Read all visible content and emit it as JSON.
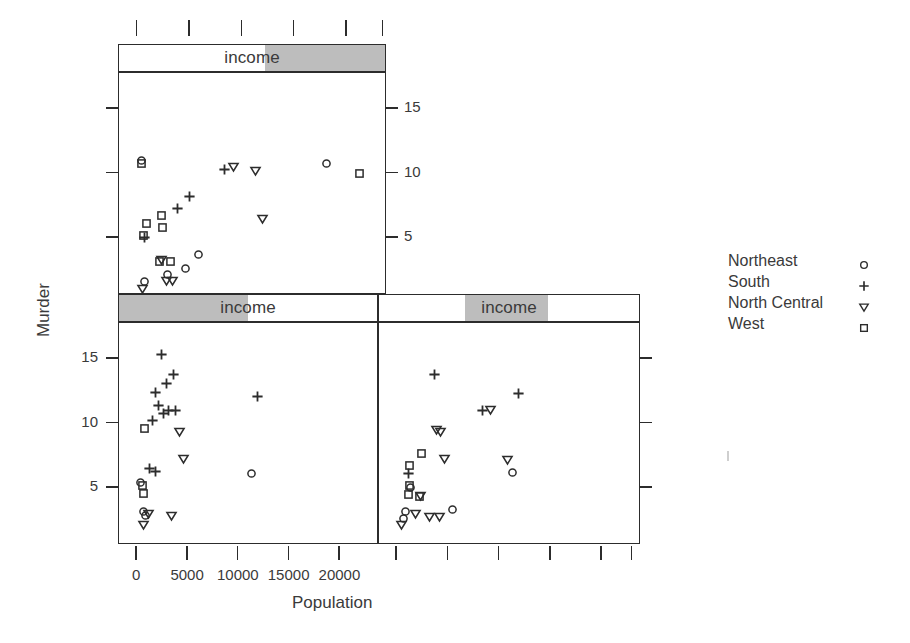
{
  "figure": {
    "type": "trellis-scatter-conditioned",
    "xlabel": "Population",
    "ylabel": "Murder",
    "strip_variable": "income"
  },
  "chart_data": {
    "type": "scatter",
    "title": "",
    "xlabel": "Population",
    "ylabel": "Murder",
    "xlim": [
      -1800,
      23800
    ],
    "ylim": [
      0.6,
      17.8
    ],
    "xticks": [
      0,
      5000,
      10000,
      15000,
      20000
    ],
    "xticklabels": [
      "0",
      "5000",
      "10000",
      "15000",
      "20000"
    ],
    "yticks": [
      5,
      10,
      15
    ],
    "yticklabels": [
      "5",
      "10",
      "15"
    ],
    "grid": false,
    "legend_position": "right",
    "conditioning": {
      "variable": "income",
      "panels": [
        {
          "id": "panel-3",
          "strip_label": "income",
          "shade_start_pct": 55,
          "shade_end_pct": 100,
          "position": "top-left",
          "yaxis_side": "right"
        },
        {
          "id": "panel-1",
          "strip_label": "income",
          "shade_start_pct": 0,
          "shade_end_pct": 50,
          "position": "bottom-left",
          "yaxis_side": "left"
        },
        {
          "id": "panel-2",
          "strip_label": "income",
          "shade_start_pct": 33,
          "shade_end_pct": 65,
          "position": "bottom-right",
          "yaxis_side": "right"
        }
      ]
    },
    "groups": [
      {
        "name": "Northeast",
        "symbol": "circle",
        "glyph": "o"
      },
      {
        "name": "South",
        "symbol": "plus",
        "glyph": "+"
      },
      {
        "name": "North Central",
        "symbol": "triangle-down",
        "glyph": "▽"
      },
      {
        "name": "West",
        "symbol": "square",
        "glyph": "□"
      }
    ],
    "series": [
      {
        "panel": "panel-3",
        "points": [
          {
            "x": 365,
            "y": 10.9,
            "group": "West"
          },
          {
            "x": 365,
            "y": 11.1,
            "group": "Northeast"
          },
          {
            "x": 8277,
            "y": 10.4,
            "group": "South"
          },
          {
            "x": 9111,
            "y": 10.6,
            "group": "North Central"
          },
          {
            "x": 11197,
            "y": 10.3,
            "group": "North Central"
          },
          {
            "x": 17990,
            "y": 10.9,
            "group": "Northeast"
          },
          {
            "x": 21198,
            "y": 10.1,
            "group": "West"
          },
          {
            "x": 4931,
            "y": 8.3,
            "group": "South"
          },
          {
            "x": 3806,
            "y": 7.4,
            "group": "South"
          },
          {
            "x": 2284,
            "y": 6.8,
            "group": "West"
          },
          {
            "x": 11860,
            "y": 6.6,
            "group": "North Central"
          },
          {
            "x": 812,
            "y": 6.2,
            "group": "West"
          },
          {
            "x": 2341,
            "y": 5.9,
            "group": "West"
          },
          {
            "x": 579,
            "y": 5.3,
            "group": "West"
          },
          {
            "x": 637,
            "y": 5.1,
            "group": "South"
          },
          {
            "x": 2110,
            "y": 3.3,
            "group": "West"
          },
          {
            "x": 2280,
            "y": 3.4,
            "group": "North Central"
          },
          {
            "x": 3100,
            "y": 3.3,
            "group": "West"
          },
          {
            "x": 5814,
            "y": 3.8,
            "group": "Northeast"
          },
          {
            "x": 4589,
            "y": 2.7,
            "group": "Northeast"
          },
          {
            "x": 2861,
            "y": 2.3,
            "group": "Northeast"
          },
          {
            "x": 623,
            "y": 1.7,
            "group": "Northeast"
          },
          {
            "x": 2715,
            "y": 1.8,
            "group": "North Central"
          },
          {
            "x": 3301,
            "y": 1.8,
            "group": "North Central"
          },
          {
            "x": 472,
            "y": 1.2,
            "group": "North Central"
          }
        ]
      },
      {
        "panel": "panel-1",
        "points": [
          {
            "x": 2341,
            "y": 15.4,
            "group": "South"
          },
          {
            "x": 3615,
            "y": 13.9,
            "group": "South"
          },
          {
            "x": 2861,
            "y": 13.2,
            "group": "South"
          },
          {
            "x": 1799,
            "y": 12.5,
            "group": "South"
          },
          {
            "x": 2110,
            "y": 11.5,
            "group": "South"
          },
          {
            "x": 11860,
            "y": 12.2,
            "group": "South"
          },
          {
            "x": 2541,
            "y": 10.9,
            "group": "South"
          },
          {
            "x": 3100,
            "y": 11.1,
            "group": "South"
          },
          {
            "x": 3806,
            "y": 11.1,
            "group": "South"
          },
          {
            "x": 1544,
            "y": 10.3,
            "group": "South"
          },
          {
            "x": 681,
            "y": 9.7,
            "group": "West"
          },
          {
            "x": 4205,
            "y": 9.5,
            "group": "North Central"
          },
          {
            "x": 4589,
            "y": 7.4,
            "group": "North Central"
          },
          {
            "x": 1212,
            "y": 6.6,
            "group": "South"
          },
          {
            "x": 1813,
            "y": 6.4,
            "group": "South"
          },
          {
            "x": 11197,
            "y": 6.2,
            "group": "Northeast"
          },
          {
            "x": 365,
            "y": 5.5,
            "group": "Northeast"
          },
          {
            "x": 472,
            "y": 5.3,
            "group": "West"
          },
          {
            "x": 637,
            "y": 4.7,
            "group": "West"
          },
          {
            "x": 579,
            "y": 3.3,
            "group": "Northeast"
          },
          {
            "x": 812,
            "y": 3.0,
            "group": "Northeast"
          },
          {
            "x": 1058,
            "y": 3.1,
            "group": "North Central"
          },
          {
            "x": 3387,
            "y": 3.0,
            "group": "North Central"
          },
          {
            "x": 623,
            "y": 2.3,
            "group": "North Central"
          }
        ]
      },
      {
        "panel": "panel-2",
        "points": [
          {
            "x": 3615,
            "y": 13.9,
            "group": "South"
          },
          {
            "x": 11860,
            "y": 12.4,
            "group": "South"
          },
          {
            "x": 8277,
            "y": 11.1,
            "group": "South"
          },
          {
            "x": 9111,
            "y": 11.2,
            "group": "North Central"
          },
          {
            "x": 3806,
            "y": 9.6,
            "group": "North Central"
          },
          {
            "x": 4205,
            "y": 9.5,
            "group": "North Central"
          },
          {
            "x": 2341,
            "y": 7.8,
            "group": "West"
          },
          {
            "x": 4589,
            "y": 7.4,
            "group": "North Central"
          },
          {
            "x": 10735,
            "y": 7.3,
            "group": "North Central"
          },
          {
            "x": 1212,
            "y": 6.8,
            "group": "West"
          },
          {
            "x": 11197,
            "y": 6.3,
            "group": "Northeast"
          },
          {
            "x": 1058,
            "y": 6.2,
            "group": "South"
          },
          {
            "x": 1144,
            "y": 5.3,
            "group": "West"
          },
          {
            "x": 1300,
            "y": 5.1,
            "group": "Northeast"
          },
          {
            "x": 1100,
            "y": 4.6,
            "group": "West"
          },
          {
            "x": 2110,
            "y": 4.4,
            "group": "West"
          },
          {
            "x": 2280,
            "y": 4.5,
            "group": "North Central"
          },
          {
            "x": 812,
            "y": 3.3,
            "group": "Northeast"
          },
          {
            "x": 1813,
            "y": 3.1,
            "group": "North Central"
          },
          {
            "x": 579,
            "y": 2.7,
            "group": "Northeast"
          },
          {
            "x": 3100,
            "y": 2.9,
            "group": "North Central"
          },
          {
            "x": 4100,
            "y": 2.9,
            "group": "North Central"
          },
          {
            "x": 5400,
            "y": 3.4,
            "group": "Northeast"
          },
          {
            "x": 365,
            "y": 2.3,
            "group": "North Central"
          }
        ]
      }
    ]
  },
  "legend": {
    "entries": [
      {
        "label": "Northeast",
        "glyph": "o"
      },
      {
        "label": "South",
        "glyph": "+"
      },
      {
        "label": "North Central",
        "glyph": "▽"
      },
      {
        "label": "West",
        "glyph": "□"
      }
    ]
  },
  "strips": {
    "top": {
      "label": "income"
    },
    "bottom_left": {
      "label": "income"
    },
    "bottom_right": {
      "label": "income"
    }
  },
  "axes": {
    "x_title": "Population",
    "y_title": "Murder",
    "x_ticklabels": [
      "0",
      "5000",
      "10000",
      "15000",
      "20000"
    ],
    "y_ticklabels": [
      "15",
      "10",
      "5"
    ]
  }
}
